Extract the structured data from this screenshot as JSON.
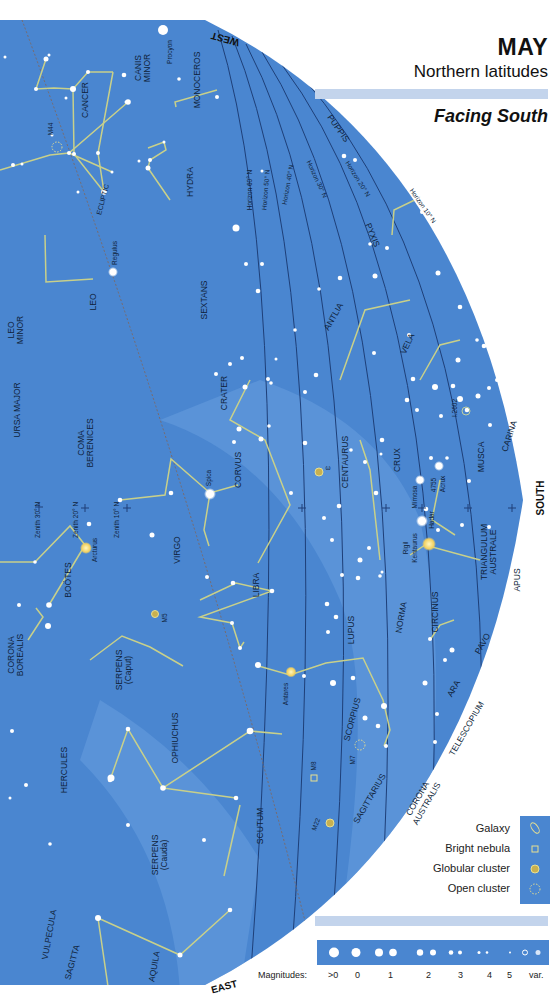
{
  "header": {
    "month": "MAY",
    "region": "Northern latitudes",
    "facing": "Facing South"
  },
  "colors": {
    "sky": "#4a86d0",
    "sky_light": "#6aa0e0",
    "band": "#c3d4ec",
    "constellation_line": "#c8d08a",
    "horizon_line": "#1e3f78",
    "text": "#0f1f3a"
  },
  "directions": {
    "west": "WEST",
    "south": "SOUTH",
    "east": "EAST"
  },
  "horizons": [
    "Horizon 60° N",
    "Horizon 50° N",
    "Horizon 40° N",
    "Horizon 30° N",
    "Horizon 20° N",
    "Horizon 10° N"
  ],
  "zeniths": [
    "Zenith 30° N",
    "Zenith 20° N",
    "Zenith 10° N"
  ],
  "ecliptic_label": "ECLIPTIC",
  "constellations": [
    "CANIS MINOR",
    "MONOCEROS",
    "CANCER",
    "HYDRA",
    "PUPPIS",
    "PYXIS",
    "LEO",
    "SEXTANS",
    "LEO MINOR",
    "URSA MAJOR",
    "ANTLIA",
    "VELA",
    "CRATER",
    "COMA BERENICES",
    "CORVUS",
    "CENTAURUS",
    "CRUX",
    "MUSCA",
    "CARINA",
    "VIRGO",
    "BOÖTES",
    "TRIANGULUM AUSTRALE",
    "APUS",
    "LIBRA",
    "CIRCINUS",
    "NORMA",
    "LUPUS",
    "CORONA BOREALIS",
    "SERPENS (Caput)",
    "PAVO",
    "ARA",
    "SCORPIUS",
    "OPHIUCHUS",
    "HERCULES",
    "TELESCOPIUM",
    "CORONA AUSTRALIS",
    "SAGITTARIUS",
    "SCUTUM",
    "SERPENS (Cauda)",
    "VULPECULA",
    "SAGITTA",
    "AQUILA"
  ],
  "stars": [
    "Procyon",
    "Regulus",
    "Spica",
    "Arcturus",
    "Mimosa",
    "Acrux",
    "Hadar",
    "Rigil Kentaurus",
    "Antares"
  ],
  "deep_sky": [
    "M44",
    "M5",
    "M7",
    "M8",
    "M22",
    "4755",
    "I.2602",
    "ω"
  ],
  "legend": {
    "items": [
      {
        "label": "Galaxy",
        "icon": "galaxy-icon"
      },
      {
        "label": "Bright nebula",
        "icon": "nebula-icon"
      },
      {
        "label": "Globular cluster",
        "icon": "globular-cluster-icon"
      },
      {
        "label": "Open cluster",
        "icon": "open-cluster-icon"
      }
    ]
  },
  "magnitudes": {
    "label": "Magnitudes:",
    "values": [
      ">0",
      "0",
      "1",
      "2",
      "3",
      "4",
      "5",
      "var."
    ]
  }
}
